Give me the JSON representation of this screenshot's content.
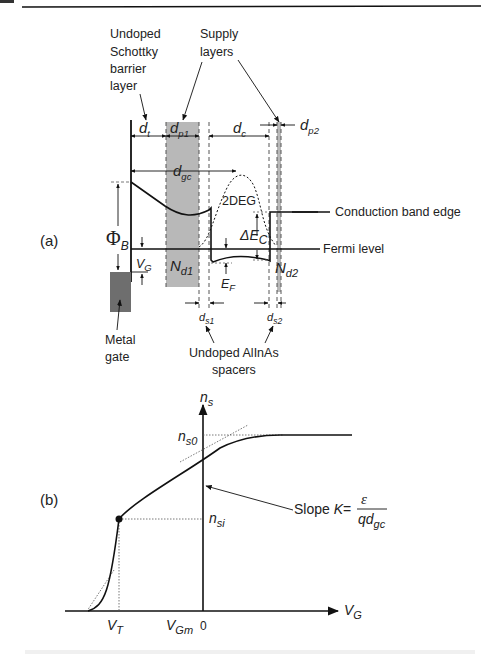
{
  "figure": {
    "panel_a_label": "(a)",
    "panel_b_label": "(b)",
    "colors": {
      "line": "#111111",
      "supply_layer": "#b8b8b8",
      "gate": "#6e6e6e",
      "text": "#222222"
    },
    "panel_a": {
      "annotations": {
        "schottky_layer": [
          "Undoped",
          "Schottky",
          "barrier",
          "layer"
        ],
        "supply_layers": [
          "Supply",
          "layers"
        ],
        "metal_gate": [
          "Metal",
          "gate"
        ],
        "spacers": [
          "Undoped AlInAs",
          "spacers"
        ],
        "conduction_band": "Conduction band edge",
        "fermi_level": "Fermi level",
        "two_deg": "2DEG"
      },
      "symbols": {
        "dt": {
          "main": "d",
          "sub": "t"
        },
        "dp1": {
          "main": "d",
          "sub": "p1"
        },
        "dc": {
          "main": "d",
          "sub": "c"
        },
        "dp2": {
          "main": "d",
          "sub": "p2"
        },
        "dgc": {
          "main": "d",
          "sub": "gc"
        },
        "phiB": {
          "main": "Φ",
          "sub": "B"
        },
        "VG": {
          "main": "V",
          "sub": "G"
        },
        "Nd1": {
          "main": "N",
          "sub": "d1"
        },
        "Nd2": {
          "main": "N",
          "sub": "d2"
        },
        "EF": {
          "main": "E",
          "sub": "F"
        },
        "dEC": {
          "main": "ΔE",
          "sub": "C"
        },
        "ds1": {
          "main": "d",
          "sub": "s1"
        },
        "ds2": {
          "main": "d",
          "sub": "s2"
        }
      }
    },
    "panel_b": {
      "y_axis": {
        "main": "n",
        "sub": "s"
      },
      "x_axis": {
        "main": "V",
        "sub": "G"
      },
      "ns0": {
        "main": "n",
        "sub": "s0"
      },
      "nsi": {
        "main": "n",
        "sub": "si"
      },
      "VT": {
        "main": "V",
        "sub": "T"
      },
      "VGm": {
        "main": "V",
        "sub": "Gm"
      },
      "zero": "0",
      "slope_label": "Slope ",
      "slope_K": "K",
      "equals": "=",
      "numerator": "ε",
      "denominator": {
        "main": "qd",
        "sub": "gc"
      }
    }
  }
}
